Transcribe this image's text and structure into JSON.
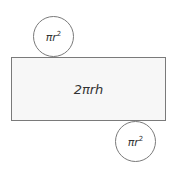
{
  "diagram": {
    "rectangle": {
      "label": "2πrh",
      "fill": "#f7f7f7",
      "stroke": "#7a7a7a"
    },
    "circles": [
      {
        "position": "top",
        "base": "πr",
        "exponent": "2"
      },
      {
        "position": "bottom",
        "base": "πr",
        "exponent": "2"
      }
    ]
  }
}
